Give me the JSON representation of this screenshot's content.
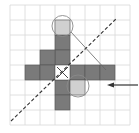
{
  "diagram": {
    "grid": {
      "cols": 8,
      "rows": 8,
      "cell": 15,
      "origin_x": 10,
      "origin_y": 5,
      "line_color": "#d8d8d8"
    },
    "colors": {
      "dark_cell": "#7a7a7a",
      "light_cell": "#d0d0d0",
      "white_cell": "#ffffff",
      "cell_border": "#555555",
      "stroke": "#333333"
    },
    "dark_cells": [
      [
        3,
        2
      ],
      [
        3,
        3
      ],
      [
        2,
        3
      ],
      [
        1,
        4
      ],
      [
        2,
        4
      ],
      [
        4,
        4
      ],
      [
        5,
        4
      ],
      [
        6,
        4
      ],
      [
        3,
        5
      ],
      [
        3,
        6
      ]
    ],
    "light_cells": [
      [
        3,
        1
      ],
      [
        4,
        5
      ]
    ],
    "x_cell": [
      3,
      4
    ],
    "circles": [
      {
        "cx": 62.5,
        "cy": 26,
        "r": 10.5
      },
      {
        "cx": 78,
        "cy": 86,
        "r": 11
      }
    ],
    "dashed_line": {
      "x1": 11,
      "y1": 121,
      "x2": 116,
      "y2": 19
    },
    "thin_line": {
      "x1": 71,
      "y1": 32,
      "x2": 106,
      "y2": 70
    },
    "arrow": {
      "x1": 138,
      "y1": 85,
      "x2": 107,
      "y2": 85,
      "direction": "left"
    }
  }
}
